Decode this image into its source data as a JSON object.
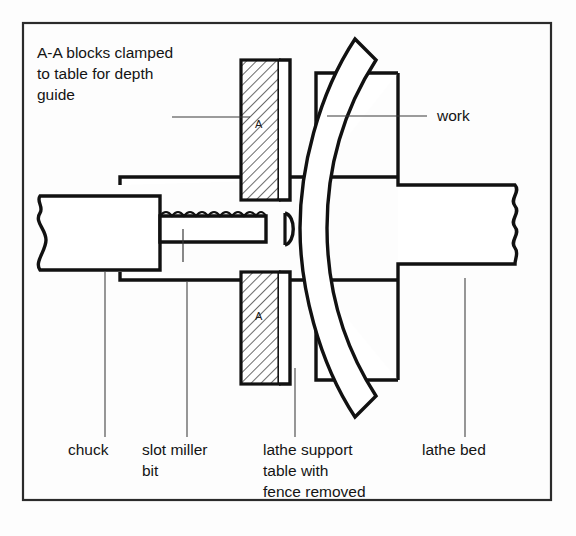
{
  "figure": {
    "background_color": "#fdfdfd",
    "line_color": "#111111",
    "frame_color": "#2b2b2b",
    "text_color": "#141414"
  },
  "notes": {
    "top_left": {
      "lines": [
        "A-A blocks clamped",
        "to table for depth",
        "guide"
      ],
      "line1": "A-A blocks clamped",
      "line2": "to table for depth",
      "line3": "guide"
    }
  },
  "callouts": {
    "work": {
      "label": "work"
    },
    "chuck": {
      "label": "chuck"
    },
    "slot_miller_bit": {
      "line1": "slot miller",
      "line2": "bit"
    },
    "lathe_support_table": {
      "line1": "lathe support",
      "line2": "table with",
      "line3": "fence removed"
    },
    "lathe_bed": {
      "label": "lathe bed"
    }
  },
  "block_markers": {
    "upper": "A",
    "lower": "A"
  }
}
